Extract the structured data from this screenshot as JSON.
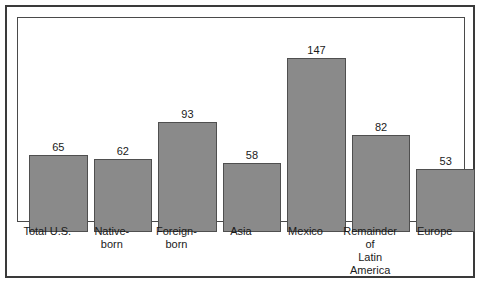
{
  "chart_data": {
    "type": "bar",
    "title": "",
    "subtitle": "",
    "xlabel": "",
    "ylabel": "",
    "ylim": [
      0,
      160
    ],
    "grid": false,
    "legend": null,
    "axis_ticks_visible": false,
    "value_labels_shown": true,
    "categories": [
      "Total U.S.",
      "Native-born",
      "Foreign-born",
      "Asia",
      "Mexico",
      "Remainder of Latin America",
      "Europe"
    ],
    "values": [
      65,
      62,
      93,
      58,
      147,
      82,
      53
    ],
    "bars": [
      {
        "label_lines": [
          "Total U.S."
        ],
        "value": 65,
        "value_text": "65"
      },
      {
        "label_lines": [
          "Native-",
          "born"
        ],
        "value": 62,
        "value_text": "62"
      },
      {
        "label_lines": [
          "Foreign-",
          "born"
        ],
        "value": 93,
        "value_text": "93"
      },
      {
        "label_lines": [
          "Asia"
        ],
        "value": 58,
        "value_text": "58"
      },
      {
        "label_lines": [
          "Mexico"
        ],
        "value": 147,
        "value_text": "147"
      },
      {
        "label_lines": [
          "Remainder",
          "of",
          "Latin America"
        ],
        "value": 82,
        "value_text": "82"
      },
      {
        "label_lines": [
          "Europe"
        ],
        "value": 53,
        "value_text": "53"
      }
    ]
  },
  "style": {
    "bar_fill": "#8a8a8a",
    "bar_stroke": "#4f4f4f",
    "frame_stroke": "#4a4a4a",
    "outer_border": "#3a3a3a",
    "background": "#ffffff",
    "text_color": "#1a1a1a"
  }
}
